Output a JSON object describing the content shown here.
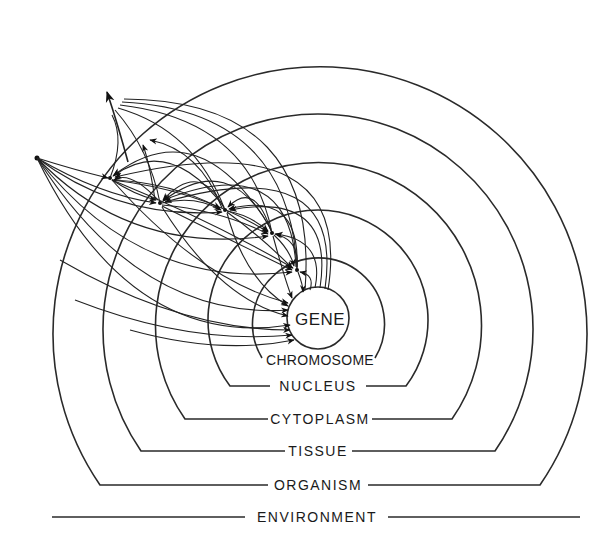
{
  "diagram": {
    "title": "",
    "levels": [
      {
        "id": "gene",
        "label": "GENE"
      },
      {
        "id": "chromosome",
        "label": "CHROMOSOME"
      },
      {
        "id": "nucleus",
        "label": "NUCLEUS"
      },
      {
        "id": "cytoplasm",
        "label": "CYTOPLASM"
      },
      {
        "id": "tissue",
        "label": "TISSUE"
      },
      {
        "id": "organism",
        "label": "ORGANISM"
      },
      {
        "id": "environment",
        "label": "ENVIRONMENT"
      }
    ],
    "colors": {
      "line": "#2a2a2a",
      "background": "#ffffff"
    }
  }
}
